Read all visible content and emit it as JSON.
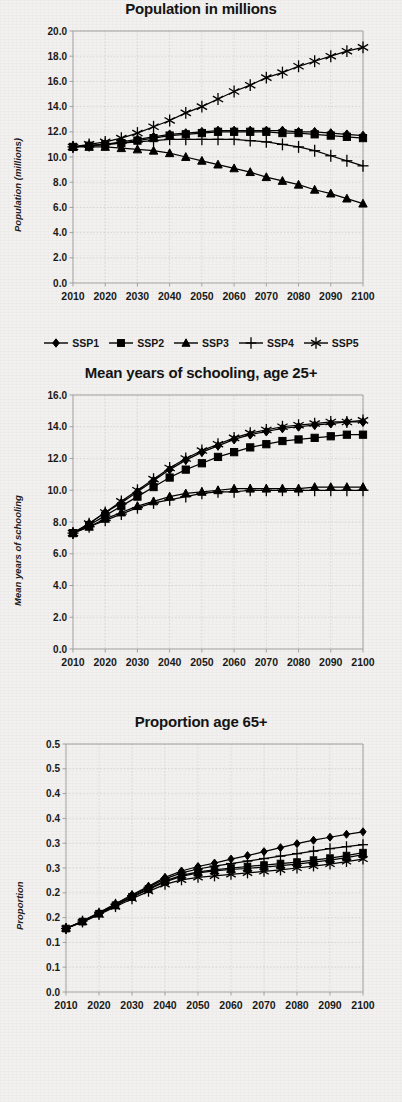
{
  "document": {
    "kind": "figure-page",
    "panel_count": 3
  },
  "legend": {
    "position": "below-first-chart",
    "items": [
      {
        "label": "SSP1",
        "marker": "diamond"
      },
      {
        "label": "SSP2",
        "marker": "square"
      },
      {
        "label": "SSP3",
        "marker": "triangle"
      },
      {
        "label": "SSP4",
        "marker": "plus"
      },
      {
        "label": "SSP5",
        "marker": "asterisk"
      }
    ]
  },
  "charts": [
    {
      "id": "population",
      "title": "Population in millions",
      "ylabel": "Population (millions)",
      "xlabel": ""
    },
    {
      "id": "schooling",
      "title": "Mean years of schooling, age 25+",
      "ylabel": "Mean years of schooling",
      "xlabel": ""
    },
    {
      "id": "proportion65",
      "title": "Proportion age 65+",
      "ylabel": "Proportion",
      "xlabel": ""
    }
  ],
  "chart_data": [
    {
      "type": "line",
      "title": "Population in millions",
      "xlabel": "",
      "ylabel": "Population (millions)",
      "grid": true,
      "legend_position": "bottom",
      "xlim": [
        2010,
        2100
      ],
      "ylim": [
        0.0,
        20.0
      ],
      "yticks": [
        "0.0",
        "2.0",
        "4.0",
        "6.0",
        "8.0",
        "10.0",
        "12.0",
        "14.0",
        "16.0",
        "18.0",
        "20.0"
      ],
      "xticks": [
        "2010",
        "2020",
        "2030",
        "2040",
        "2050",
        "2060",
        "2070",
        "2080",
        "2090",
        "2100"
      ],
      "x": [
        2010,
        2015,
        2020,
        2025,
        2030,
        2035,
        2040,
        2045,
        2050,
        2055,
        2060,
        2065,
        2070,
        2075,
        2080,
        2085,
        2090,
        2095,
        2100
      ],
      "series": [
        {
          "name": "SSP1",
          "marker": "diamond",
          "values": [
            10.8,
            10.9,
            11.0,
            11.2,
            11.4,
            11.6,
            11.8,
            11.9,
            12.0,
            12.1,
            12.1,
            12.1,
            12.1,
            12.1,
            12.0,
            12.0,
            11.9,
            11.8,
            11.7
          ]
        },
        {
          "name": "SSP2",
          "marker": "square",
          "values": [
            10.8,
            10.9,
            11.0,
            11.1,
            11.3,
            11.5,
            11.7,
            11.8,
            11.9,
            12.0,
            12.0,
            12.0,
            12.0,
            11.9,
            11.9,
            11.8,
            11.7,
            11.6,
            11.5
          ]
        },
        {
          "name": "SSP3",
          "marker": "triangle",
          "values": [
            10.8,
            10.8,
            10.8,
            10.7,
            10.6,
            10.5,
            10.3,
            10.0,
            9.7,
            9.4,
            9.1,
            8.8,
            8.4,
            8.1,
            7.8,
            7.4,
            7.1,
            6.7,
            6.3
          ]
        },
        {
          "name": "SSP4",
          "marker": "plus",
          "values": [
            10.8,
            10.9,
            11.0,
            11.1,
            11.2,
            11.3,
            11.4,
            11.4,
            11.4,
            11.4,
            11.4,
            11.3,
            11.2,
            11.0,
            10.8,
            10.5,
            10.1,
            9.7,
            9.3
          ]
        },
        {
          "name": "SSP5",
          "marker": "asterisk",
          "values": [
            10.8,
            11.0,
            11.2,
            11.5,
            11.9,
            12.4,
            12.9,
            13.5,
            14.0,
            14.6,
            15.2,
            15.7,
            16.3,
            16.7,
            17.2,
            17.6,
            18.0,
            18.4,
            18.7
          ]
        }
      ]
    },
    {
      "type": "line",
      "title": "Mean years of schooling, age 25+",
      "xlabel": "",
      "ylabel": "Mean years of schooling",
      "grid": true,
      "legend_position": "shared-top-panel",
      "xlim": [
        2010,
        2100
      ],
      "ylim": [
        0.0,
        16.0
      ],
      "yticks": [
        "0.0",
        "2.0",
        "4.0",
        "6.0",
        "8.0",
        "10.0",
        "12.0",
        "14.0",
        "16.0"
      ],
      "xticks": [
        "2010",
        "2020",
        "2030",
        "2040",
        "2050",
        "2060",
        "2070",
        "2080",
        "2090",
        "2100"
      ],
      "x": [
        2010,
        2015,
        2020,
        2025,
        2030,
        2035,
        2040,
        2045,
        2050,
        2055,
        2060,
        2065,
        2070,
        2075,
        2080,
        2085,
        2090,
        2095,
        2100
      ],
      "series": [
        {
          "name": "SSP1",
          "marker": "diamond",
          "values": [
            7.3,
            7.9,
            8.6,
            9.2,
            9.9,
            10.6,
            11.3,
            11.9,
            12.4,
            12.8,
            13.2,
            13.5,
            13.7,
            13.9,
            14.0,
            14.1,
            14.2,
            14.3,
            14.3
          ]
        },
        {
          "name": "SSP2",
          "marker": "square",
          "values": [
            7.3,
            7.8,
            8.4,
            9.0,
            9.6,
            10.2,
            10.8,
            11.3,
            11.7,
            12.1,
            12.4,
            12.7,
            12.9,
            13.1,
            13.2,
            13.3,
            13.4,
            13.5,
            13.5
          ]
        },
        {
          "name": "SSP3",
          "marker": "triangle",
          "values": [
            7.3,
            7.7,
            8.2,
            8.6,
            9.0,
            9.3,
            9.6,
            9.8,
            9.9,
            10.0,
            10.1,
            10.1,
            10.1,
            10.1,
            10.1,
            10.2,
            10.2,
            10.2,
            10.2
          ]
        },
        {
          "name": "SSP4",
          "marker": "plus",
          "values": [
            7.3,
            7.7,
            8.1,
            8.5,
            8.9,
            9.2,
            9.4,
            9.6,
            9.8,
            9.9,
            9.9,
            10.0,
            10.0,
            10.0,
            10.0,
            10.0,
            10.0,
            10.0,
            10.0
          ]
        },
        {
          "name": "SSP5",
          "marker": "asterisk",
          "values": [
            7.3,
            7.9,
            8.6,
            9.3,
            10.0,
            10.7,
            11.4,
            12.0,
            12.5,
            12.9,
            13.3,
            13.6,
            13.8,
            14.0,
            14.1,
            14.2,
            14.3,
            14.3,
            14.4
          ]
        }
      ]
    },
    {
      "type": "line",
      "title": "Proportion age 65+",
      "xlabel": "",
      "ylabel": "Proportion",
      "grid": true,
      "legend_position": "shared-top-panel",
      "xlim": [
        2010,
        2100
      ],
      "ylim": [
        0.0,
        0.5
      ],
      "yticks": [
        "0.0",
        "0.1",
        "0.1",
        "0.2",
        "0.2",
        "0.3",
        "0.3",
        "0.4",
        "0.4",
        "0.5",
        "0.5"
      ],
      "ytick_values": [
        0.0,
        0.05,
        0.1,
        0.15,
        0.2,
        0.25,
        0.3,
        0.35,
        0.4,
        0.45,
        0.5
      ],
      "xticks": [
        "2010",
        "2020",
        "2030",
        "2040",
        "2050",
        "2060",
        "2070",
        "2080",
        "2090",
        "2100"
      ],
      "x": [
        2010,
        2015,
        2020,
        2025,
        2030,
        2035,
        2040,
        2045,
        2050,
        2055,
        2060,
        2065,
        2070,
        2075,
        2080,
        2085,
        2090,
        2095,
        2100
      ],
      "series": [
        {
          "name": "SSP1",
          "marker": "diamond",
          "values": [
            0.128,
            0.143,
            0.16,
            0.178,
            0.196,
            0.213,
            0.231,
            0.244,
            0.253,
            0.26,
            0.268,
            0.275,
            0.283,
            0.291,
            0.299,
            0.306,
            0.312,
            0.318,
            0.323
          ]
        },
        {
          "name": "SSP2",
          "marker": "square",
          "values": [
            0.128,
            0.142,
            0.158,
            0.175,
            0.192,
            0.208,
            0.224,
            0.235,
            0.242,
            0.246,
            0.25,
            0.253,
            0.256,
            0.259,
            0.262,
            0.266,
            0.27,
            0.275,
            0.281
          ]
        },
        {
          "name": "SSP3",
          "marker": "triangle",
          "values": [
            0.128,
            0.142,
            0.158,
            0.174,
            0.191,
            0.207,
            0.222,
            0.233,
            0.24,
            0.244,
            0.247,
            0.249,
            0.252,
            0.255,
            0.258,
            0.262,
            0.266,
            0.271,
            0.277
          ]
        },
        {
          "name": "SSP4",
          "marker": "plus",
          "values": [
            0.128,
            0.143,
            0.159,
            0.177,
            0.194,
            0.211,
            0.228,
            0.24,
            0.248,
            0.254,
            0.259,
            0.264,
            0.269,
            0.274,
            0.279,
            0.284,
            0.289,
            0.293,
            0.297
          ]
        },
        {
          "name": "SSP5",
          "marker": "asterisk",
          "values": [
            0.128,
            0.141,
            0.156,
            0.172,
            0.188,
            0.203,
            0.217,
            0.226,
            0.231,
            0.234,
            0.237,
            0.24,
            0.243,
            0.246,
            0.25,
            0.254,
            0.258,
            0.263,
            0.268
          ]
        }
      ]
    }
  ]
}
